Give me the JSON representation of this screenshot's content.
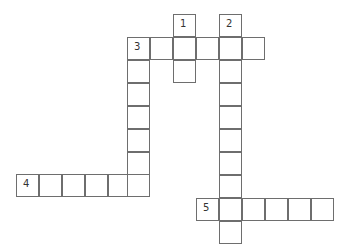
{
  "puzzle": {
    "type": "crossword",
    "cell_size": 23,
    "border_color": "#6e6e6e",
    "cells": [
      {
        "x": 173,
        "y": 14,
        "num": "1"
      },
      {
        "x": 219,
        "y": 14,
        "num": "2"
      },
      {
        "x": 127,
        "y": 37,
        "num": "3"
      },
      {
        "x": 150,
        "y": 37
      },
      {
        "x": 173,
        "y": 37
      },
      {
        "x": 196,
        "y": 37
      },
      {
        "x": 219,
        "y": 37
      },
      {
        "x": 242,
        "y": 37
      },
      {
        "x": 173,
        "y": 60
      },
      {
        "x": 127,
        "y": 60
      },
      {
        "x": 219,
        "y": 60
      },
      {
        "x": 127,
        "y": 83
      },
      {
        "x": 219,
        "y": 83
      },
      {
        "x": 127,
        "y": 106
      },
      {
        "x": 219,
        "y": 106
      },
      {
        "x": 127,
        "y": 129
      },
      {
        "x": 219,
        "y": 129
      },
      {
        "x": 127,
        "y": 152
      },
      {
        "x": 219,
        "y": 152
      },
      {
        "x": 16,
        "y": 174,
        "num": "4"
      },
      {
        "x": 39,
        "y": 174
      },
      {
        "x": 62,
        "y": 174
      },
      {
        "x": 85,
        "y": 174
      },
      {
        "x": 108,
        "y": 174
      },
      {
        "x": 127,
        "y": 174
      },
      {
        "x": 219,
        "y": 175
      },
      {
        "x": 196,
        "y": 198,
        "num": "5"
      },
      {
        "x": 219,
        "y": 198
      },
      {
        "x": 242,
        "y": 198
      },
      {
        "x": 265,
        "y": 198
      },
      {
        "x": 288,
        "y": 198
      },
      {
        "x": 311,
        "y": 198
      },
      {
        "x": 219,
        "y": 221
      }
    ],
    "clues": {
      "down": [
        {
          "number": "1",
          "length": 3
        },
        {
          "number": "2",
          "length": 10
        },
        {
          "number": "3",
          "length": 7
        }
      ],
      "across": [
        {
          "number": "3",
          "length": 6
        },
        {
          "number": "4",
          "length": 6
        },
        {
          "number": "5",
          "length": 6
        }
      ]
    }
  }
}
